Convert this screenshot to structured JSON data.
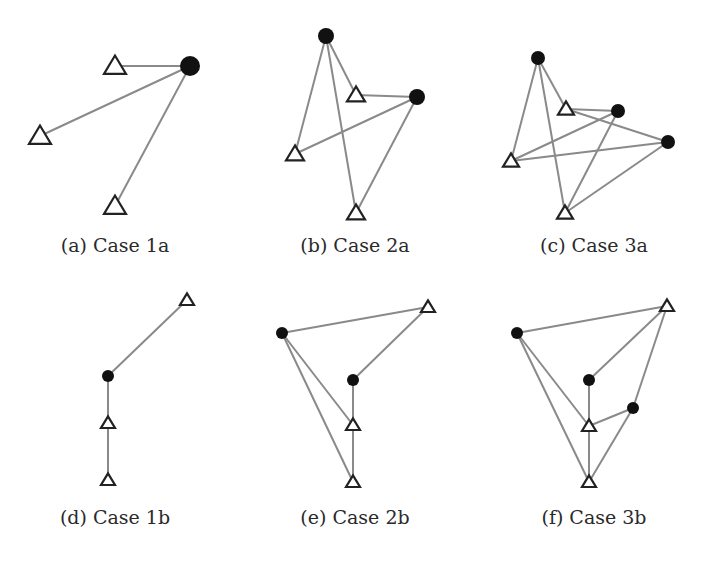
{
  "colors": {
    "edge": "#8a8a8a",
    "circle": "#111111",
    "triangle_stroke": "#222222",
    "background": "#ffffff"
  },
  "panels": [
    {
      "id": "a",
      "caption": "(a) Case 1a",
      "caption_pos": [
        115,
        236
      ],
      "circles": [
        [
          190,
          66,
          10
        ]
      ],
      "triangles": [
        [
          115,
          66,
          11
        ],
        [
          40,
          136,
          11
        ],
        [
          115,
          206,
          11
        ]
      ],
      "edges": [
        [
          [
            190,
            66
          ],
          [
            115,
            66
          ]
        ],
        [
          [
            190,
            66
          ],
          [
            40,
            136
          ]
        ],
        [
          [
            190,
            66
          ],
          [
            115,
            206
          ]
        ]
      ]
    },
    {
      "id": "b",
      "caption": "(b) Case 2a",
      "caption_pos": [
        355,
        236
      ],
      "circles": [
        [
          326,
          36,
          8
        ],
        [
          417,
          97,
          8
        ]
      ],
      "triangles": [
        [
          356,
          95,
          9
        ],
        [
          295,
          154,
          9
        ],
        [
          356,
          213,
          9
        ]
      ],
      "edges": [
        [
          [
            326,
            36
          ],
          [
            356,
            95
          ]
        ],
        [
          [
            326,
            36
          ],
          [
            295,
            154
          ]
        ],
        [
          [
            326,
            36
          ],
          [
            356,
            213
          ]
        ],
        [
          [
            417,
            97
          ],
          [
            356,
            95
          ]
        ],
        [
          [
            417,
            97
          ],
          [
            295,
            154
          ]
        ],
        [
          [
            417,
            97
          ],
          [
            356,
            213
          ]
        ]
      ]
    },
    {
      "id": "c",
      "caption": "(c) Case 3a",
      "caption_pos": [
        594,
        236
      ],
      "circles": [
        [
          538,
          58,
          7
        ],
        [
          618,
          111,
          7
        ],
        [
          668,
          142,
          7
        ]
      ],
      "triangles": [
        [
          566,
          109,
          8
        ],
        [
          511,
          161,
          8
        ],
        [
          565,
          213,
          8
        ]
      ],
      "edges": [
        [
          [
            538,
            58
          ],
          [
            566,
            109
          ]
        ],
        [
          [
            538,
            58
          ],
          [
            511,
            161
          ]
        ],
        [
          [
            538,
            58
          ],
          [
            565,
            213
          ]
        ],
        [
          [
            618,
            111
          ],
          [
            566,
            109
          ]
        ],
        [
          [
            618,
            111
          ],
          [
            511,
            161
          ]
        ],
        [
          [
            618,
            111
          ],
          [
            565,
            213
          ]
        ],
        [
          [
            668,
            142
          ],
          [
            566,
            109
          ]
        ],
        [
          [
            668,
            142
          ],
          [
            511,
            161
          ]
        ],
        [
          [
            668,
            142
          ],
          [
            565,
            213
          ]
        ]
      ]
    },
    {
      "id": "d",
      "caption": "(d) Case 1b",
      "caption_pos": [
        115,
        508
      ],
      "circles": [
        [
          108,
          376,
          6
        ]
      ],
      "triangles": [
        [
          187,
          300,
          7
        ],
        [
          108,
          423,
          7
        ],
        [
          108,
          480,
          7
        ]
      ],
      "edges": [
        [
          [
            108,
            376
          ],
          [
            187,
            300
          ]
        ],
        [
          [
            108,
            376
          ],
          [
            108,
            423
          ]
        ],
        [
          [
            108,
            423
          ],
          [
            108,
            480
          ]
        ]
      ]
    },
    {
      "id": "e",
      "caption": "(e) Case 2b",
      "caption_pos": [
        355,
        508
      ],
      "circles": [
        [
          282,
          333,
          6
        ],
        [
          353,
          380,
          6
        ]
      ],
      "triangles": [
        [
          428,
          307,
          7
        ],
        [
          353,
          425,
          7
        ],
        [
          353,
          482,
          7
        ]
      ],
      "edges": [
        [
          [
            282,
            333
          ],
          [
            428,
            307
          ]
        ],
        [
          [
            282,
            333
          ],
          [
            353,
            425
          ]
        ],
        [
          [
            282,
            333
          ],
          [
            353,
            482
          ]
        ],
        [
          [
            353,
            380
          ],
          [
            428,
            307
          ]
        ],
        [
          [
            353,
            380
          ],
          [
            353,
            425
          ]
        ],
        [
          [
            353,
            425
          ],
          [
            353,
            482
          ]
        ]
      ]
    },
    {
      "id": "f",
      "caption": "(f) Case 3b",
      "caption_pos": [
        594,
        508
      ],
      "circles": [
        [
          517,
          333,
          6
        ],
        [
          589,
          380,
          6
        ],
        [
          633,
          408,
          6
        ]
      ],
      "triangles": [
        [
          667,
          306,
          7
        ],
        [
          589,
          426,
          7
        ],
        [
          589,
          482,
          7
        ]
      ],
      "edges": [
        [
          [
            517,
            333
          ],
          [
            667,
            306
          ]
        ],
        [
          [
            517,
            333
          ],
          [
            589,
            426
          ]
        ],
        [
          [
            517,
            333
          ],
          [
            589,
            482
          ]
        ],
        [
          [
            589,
            380
          ],
          [
            667,
            306
          ]
        ],
        [
          [
            589,
            380
          ],
          [
            589,
            426
          ]
        ],
        [
          [
            633,
            408
          ],
          [
            667,
            306
          ]
        ],
        [
          [
            633,
            408
          ],
          [
            589,
            426
          ]
        ],
        [
          [
            633,
            408
          ],
          [
            589,
            482
          ]
        ],
        [
          [
            589,
            426
          ],
          [
            589,
            482
          ]
        ]
      ]
    }
  ]
}
